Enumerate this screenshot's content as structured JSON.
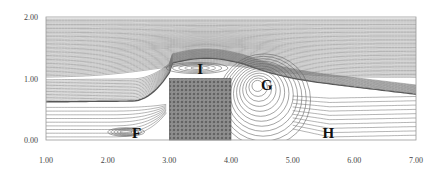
{
  "figure": {
    "type": "streamline-plot",
    "x_axis": {
      "range": [
        1.0,
        7.0
      ],
      "ticks": [
        1.0,
        2.0,
        3.0,
        4.0,
        5.0,
        6.0,
        7.0
      ],
      "tick_labels": [
        "1.00",
        "2.00",
        "3.00",
        "4.00",
        "5.00",
        "6.00",
        "7.00"
      ]
    },
    "y_axis": {
      "range": [
        0.0,
        2.0
      ],
      "ticks": [
        0.0,
        1.0,
        2.0
      ],
      "tick_labels": [
        "0.00",
        "1.00",
        "2.00"
      ]
    },
    "block": {
      "name": "porous-block",
      "x_range": [
        3.0,
        4.0
      ],
      "y_range": [
        0.0,
        1.0
      ],
      "fill_color": "#7a7a7a"
    },
    "region_labels": [
      {
        "text": "I",
        "x": 3.5,
        "y": 1.16,
        "meaning": "recirculation above block"
      },
      {
        "text": "G",
        "x": 4.58,
        "y": 0.9,
        "meaning": "downstream vortex"
      },
      {
        "text": "F",
        "x": 2.47,
        "y": 0.12,
        "meaning": "upstream corner vortex"
      },
      {
        "text": "H",
        "x": 5.58,
        "y": 0.12,
        "meaning": "reattachment region"
      }
    ],
    "vortex_centers": [
      {
        "label": "I",
        "x": 3.45,
        "y": 1.17
      },
      {
        "label": "G",
        "x": 4.42,
        "y": 0.9
      },
      {
        "label": "F",
        "x": 2.3,
        "y": 0.13
      }
    ]
  }
}
